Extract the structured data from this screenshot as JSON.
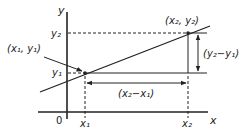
{
  "diagram": {
    "axes": {
      "x_label": "x",
      "y_label": "y",
      "origin_label": "0"
    },
    "points": [
      {
        "id": "p1",
        "label": "(x₁, y₁)",
        "x_tick": "x₁",
        "y_tick": "y₁"
      },
      {
        "id": "p2",
        "label": "(x₂, y₂)",
        "x_tick": "x₂",
        "y_tick": "y₂"
      }
    ],
    "differences": {
      "rise_label": "(y₂−y₁)",
      "run_label": "(x₂−x₁)"
    },
    "colors": {
      "line": "#222222",
      "background": "#ffffff"
    }
  }
}
